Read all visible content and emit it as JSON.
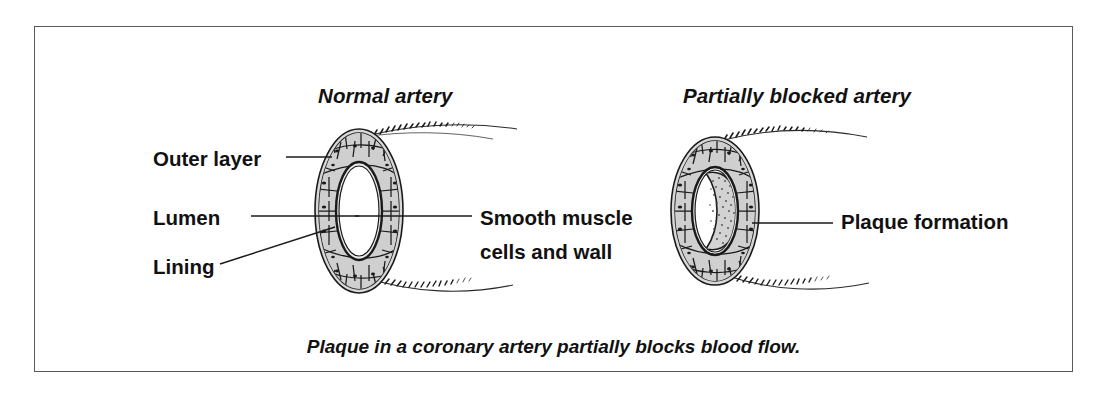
{
  "figure": {
    "caption": "Plaque in a coronary artery partially blocks blood flow.",
    "frame_color": "#5a5a5a",
    "background_color": "#ffffff",
    "ink_color": "#111111"
  },
  "panels": [
    {
      "id": "normal-artery",
      "title": "Normal artery",
      "labels": [
        {
          "id": "outer-layer",
          "text": "Outer layer"
        },
        {
          "id": "lumen",
          "text": "Lumen"
        },
        {
          "id": "lining",
          "text": "Lining"
        },
        {
          "id": "smooth-muscle",
          "text": "Smooth muscle cells and wall"
        }
      ]
    },
    {
      "id": "partially-blocked-artery",
      "title": "Partially blocked artery",
      "labels": [
        {
          "id": "plaque-formation",
          "text": "Plaque formation"
        }
      ]
    }
  ],
  "diagram_colors": {
    "outline": "#1a1a1a",
    "outer_layer_fill": "#d8d8d8",
    "muscle_cell_fill": "#cfcfcf",
    "lumen_fill": "#ffffff",
    "plaque_fill": "#d2d2d2",
    "plaque_stipple": "#4a4a4a"
  }
}
